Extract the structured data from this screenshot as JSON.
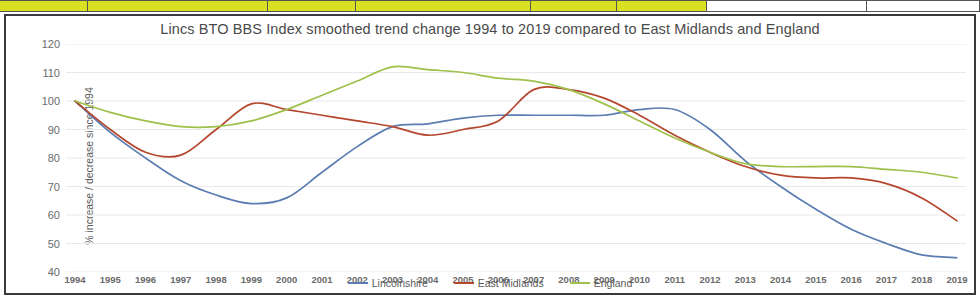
{
  "sheet_strip": {
    "cells": [
      {
        "width": 88,
        "fill": "#d9e021"
      },
      {
        "width": 180,
        "fill": "#d9e021"
      },
      {
        "width": 88,
        "fill": "#d9e021"
      },
      {
        "width": 175,
        "fill": "#d9e021"
      },
      {
        "width": 86,
        "fill": "#d9e021"
      },
      {
        "width": 90,
        "fill": "#d9e021"
      },
      {
        "width": 160,
        "fill": "#ffffff"
      },
      {
        "width": 113,
        "fill": "#ffffff"
      }
    ]
  },
  "chart_data": {
    "type": "line",
    "title": "Lincs BTO BBS Index smoothed trend change 1994 to 2019 compared to East Midlands and England",
    "xlabel": "",
    "ylabel": "% increase / decrease since 1994",
    "ylim": [
      40,
      120
    ],
    "yticks": [
      120,
      110,
      100,
      90,
      80,
      70,
      60,
      50,
      40
    ],
    "grid": true,
    "legend_position": "bottom",
    "categories": [
      "1994",
      "1995",
      "1996",
      "1997",
      "1998",
      "1999",
      "2000",
      "2001",
      "2002",
      "2003",
      "2004",
      "2005",
      "2006",
      "2007",
      "2008",
      "2009",
      "2010",
      "2011",
      "2012",
      "2013",
      "2014",
      "2015",
      "2016",
      "2017",
      "2018",
      "2019"
    ],
    "series": [
      {
        "name": "Lincolnshire",
        "color": "#5b7db1",
        "values": [
          100,
          89,
          80,
          72,
          67,
          64,
          66,
          75,
          84,
          91,
          92,
          94,
          95,
          95,
          95,
          95,
          97,
          97,
          90,
          79,
          70,
          62,
          55,
          50,
          46,
          45
        ]
      },
      {
        "name": "East Midlands",
        "color": "#b5472e",
        "values": [
          100,
          90,
          82,
          81,
          90,
          99,
          97,
          95,
          93,
          91,
          88,
          90,
          93,
          104,
          104,
          101,
          95,
          88,
          82,
          77,
          74,
          73,
          73,
          71,
          66,
          58
        ]
      },
      {
        "name": "England",
        "color": "#9fc04a",
        "values": [
          100,
          96,
          93,
          91,
          91,
          93,
          97,
          102,
          107,
          112,
          111,
          110,
          108,
          107,
          104,
          99,
          93,
          87,
          82,
          78,
          77,
          77,
          77,
          76,
          75,
          73
        ]
      }
    ]
  }
}
